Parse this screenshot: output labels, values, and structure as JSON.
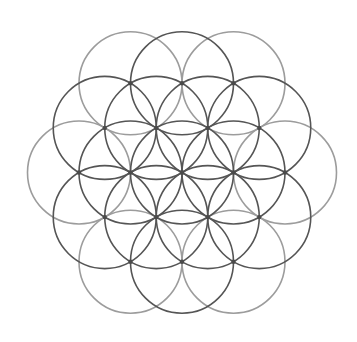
{
  "geometry": {
    "center": [
      182,
      172.5
    ],
    "radius": 51.5,
    "stroke_width": 1.6,
    "dot_radius": 2.2
  },
  "colors": {
    "background": "#ffffff",
    "dark_stroke": "#555555",
    "light_stroke": "#9c9c9c",
    "dot": "#4a4a4a"
  },
  "circles": [
    {
      "id": "center",
      "lattice": [
        0,
        0
      ],
      "tone": "dark"
    },
    {
      "id": "ring1-e",
      "lattice": [
        1,
        0
      ],
      "tone": "dark"
    },
    {
      "id": "ring1-w",
      "lattice": [
        -1,
        0
      ],
      "tone": "dark"
    },
    {
      "id": "ring1-ne",
      "lattice": [
        0,
        1
      ],
      "tone": "dark"
    },
    {
      "id": "ring1-nw",
      "lattice": [
        -1,
        1
      ],
      "tone": "dark"
    },
    {
      "id": "ring1-se",
      "lattice": [
        1,
        -1
      ],
      "tone": "dark"
    },
    {
      "id": "ring1-sw",
      "lattice": [
        0,
        -1
      ],
      "tone": "dark"
    },
    {
      "id": "ring2-n",
      "lattice": [
        -1,
        2
      ],
      "tone": "dark"
    },
    {
      "id": "ring2-s",
      "lattice": [
        1,
        -2
      ],
      "tone": "dark"
    },
    {
      "id": "ring2-ne",
      "lattice": [
        1,
        1
      ],
      "tone": "dark"
    },
    {
      "id": "ring2-nw",
      "lattice": [
        -2,
        1
      ],
      "tone": "dark"
    },
    {
      "id": "ring2-se",
      "lattice": [
        2,
        -1
      ],
      "tone": "dark"
    },
    {
      "id": "ring2-sw",
      "lattice": [
        -1,
        -1
      ],
      "tone": "dark"
    },
    {
      "id": "outer-e",
      "lattice": [
        2,
        0
      ],
      "tone": "light"
    },
    {
      "id": "outer-w",
      "lattice": [
        -2,
        0
      ],
      "tone": "light"
    },
    {
      "id": "outer-ne",
      "lattice": [
        0,
        2
      ],
      "tone": "light"
    },
    {
      "id": "outer-nw",
      "lattice": [
        -2,
        2
      ],
      "tone": "light"
    },
    {
      "id": "outer-se",
      "lattice": [
        2,
        -2
      ],
      "tone": "light"
    },
    {
      "id": "outer-sw",
      "lattice": [
        0,
        -2
      ],
      "tone": "light"
    }
  ],
  "dots": [
    [
      -1,
      2
    ],
    [
      0,
      2
    ],
    [
      -2,
      2
    ],
    [
      -2,
      0
    ],
    [
      2,
      0
    ],
    [
      0,
      -2
    ],
    [
      1,
      -2
    ],
    [
      2,
      -2
    ],
    [
      0,
      0
    ],
    [
      1,
      0
    ],
    [
      -1,
      0
    ],
    [
      0,
      1
    ],
    [
      -1,
      1
    ],
    [
      1,
      -1
    ],
    [
      0,
      -1
    ],
    [
      1,
      1
    ],
    [
      -2,
      1
    ],
    [
      2,
      -1
    ],
    [
      -1,
      -1
    ]
  ]
}
